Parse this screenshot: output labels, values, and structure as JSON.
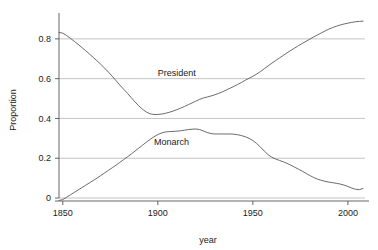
{
  "chart_data": {
    "type": "line",
    "title": "",
    "xlabel": "year",
    "ylabel": "Proportion",
    "xlim": [
      1848,
      2009
    ],
    "ylim": [
      -0.015,
      0.905
    ],
    "grid": true,
    "legend_position": "inline-annotations",
    "xticks": [
      1850,
      1900,
      1950,
      2000
    ],
    "xtick_labels": [
      "1850",
      "1900",
      "1950",
      "2000"
    ],
    "yticks": [
      0,
      0.2,
      0.4,
      0.6,
      0.8
    ],
    "ytick_labels": [
      "0",
      "0.2",
      "0.4",
      "0.6",
      "0.8"
    ],
    "line_color": "#5a5a5a",
    "grid_color": "#aaaaaa",
    "axis_color": "#555555",
    "background_color": "#ffffff",
    "series": [
      {
        "name": "President",
        "label": "President",
        "label_x": 1900,
        "label_y": 0.615,
        "x": [
          1848,
          1850,
          1852,
          1854,
          1856,
          1858,
          1860,
          1862,
          1864,
          1866,
          1868,
          1870,
          1872,
          1874,
          1876,
          1878,
          1880,
          1882,
          1884,
          1886,
          1888,
          1890,
          1892,
          1894,
          1896,
          1898,
          1900,
          1902,
          1904,
          1906,
          1908,
          1910,
          1912,
          1914,
          1916,
          1918,
          1920,
          1922,
          1924,
          1926,
          1928,
          1930,
          1932,
          1934,
          1936,
          1938,
          1940,
          1942,
          1944,
          1946,
          1948,
          1950,
          1952,
          1954,
          1956,
          1958,
          1960,
          1962,
          1964,
          1966,
          1968,
          1970,
          1972,
          1974,
          1976,
          1978,
          1980,
          1982,
          1984,
          1986,
          1988,
          1990,
          1992,
          1994,
          1996,
          1998,
          2000,
          2002,
          2004,
          2006,
          2008
        ],
        "y": [
          0.832,
          0.829,
          0.817,
          0.803,
          0.788,
          0.773,
          0.757,
          0.741,
          0.724,
          0.707,
          0.69,
          0.672,
          0.653,
          0.633,
          0.612,
          0.59,
          0.568,
          0.547,
          0.527,
          0.505,
          0.483,
          0.463,
          0.446,
          0.432,
          0.423,
          0.42,
          0.42,
          0.422,
          0.426,
          0.431,
          0.437,
          0.444,
          0.452,
          0.46,
          0.469,
          0.478,
          0.487,
          0.496,
          0.503,
          0.508,
          0.513,
          0.519,
          0.526,
          0.534,
          0.543,
          0.552,
          0.561,
          0.571,
          0.581,
          0.592,
          0.602,
          0.612,
          0.623,
          0.636,
          0.65,
          0.664,
          0.678,
          0.691,
          0.704,
          0.717,
          0.73,
          0.742,
          0.754,
          0.766,
          0.777,
          0.788,
          0.799,
          0.81,
          0.82,
          0.83,
          0.84,
          0.849,
          0.857,
          0.864,
          0.87,
          0.875,
          0.879,
          0.883,
          0.886,
          0.888,
          0.889
        ]
      },
      {
        "name": "Monarch",
        "label": "Monarch",
        "label_x": 1898,
        "label_y": 0.265,
        "x": [
          1848,
          1850,
          1852,
          1854,
          1856,
          1858,
          1860,
          1862,
          1864,
          1866,
          1868,
          1870,
          1872,
          1874,
          1876,
          1878,
          1880,
          1882,
          1884,
          1886,
          1888,
          1890,
          1892,
          1894,
          1896,
          1898,
          1900,
          1902,
          1904,
          1906,
          1908,
          1910,
          1912,
          1914,
          1916,
          1918,
          1920,
          1922,
          1924,
          1926,
          1928,
          1930,
          1932,
          1934,
          1936,
          1938,
          1940,
          1942,
          1944,
          1946,
          1948,
          1950,
          1952,
          1954,
          1956,
          1958,
          1960,
          1962,
          1964,
          1966,
          1968,
          1970,
          1972,
          1974,
          1976,
          1978,
          1980,
          1982,
          1984,
          1986,
          1988,
          1990,
          1992,
          1994,
          1996,
          1998,
          2000,
          2002,
          2004,
          2006,
          2008
        ],
        "y": [
          -0.012,
          -0.008,
          0.004,
          0.016,
          0.028,
          0.04,
          0.052,
          0.064,
          0.076,
          0.088,
          0.1,
          0.113,
          0.126,
          0.139,
          0.152,
          0.165,
          0.179,
          0.193,
          0.207,
          0.221,
          0.236,
          0.251,
          0.266,
          0.281,
          0.295,
          0.308,
          0.319,
          0.327,
          0.332,
          0.334,
          0.335,
          0.336,
          0.338,
          0.341,
          0.344,
          0.346,
          0.347,
          0.344,
          0.337,
          0.329,
          0.324,
          0.322,
          0.322,
          0.322,
          0.322,
          0.322,
          0.321,
          0.318,
          0.314,
          0.308,
          0.3,
          0.289,
          0.274,
          0.256,
          0.236,
          0.218,
          0.205,
          0.196,
          0.189,
          0.182,
          0.174,
          0.165,
          0.155,
          0.145,
          0.135,
          0.124,
          0.113,
          0.103,
          0.095,
          0.089,
          0.084,
          0.08,
          0.077,
          0.074,
          0.07,
          0.065,
          0.058,
          0.05,
          0.044,
          0.042,
          0.048
        ]
      }
    ]
  }
}
